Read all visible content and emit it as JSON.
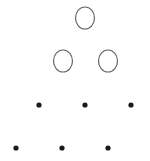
{
  "diagram": {
    "background": "#ffffff",
    "stroke_color": "#666666",
    "dot_color": "#1a1a1a",
    "circles": [
      {
        "cx": 85,
        "cy": 18,
        "rx": 9.5,
        "ry": 11
      },
      {
        "cx": 63,
        "cy": 61,
        "rx": 9.5,
        "ry": 11
      },
      {
        "cx": 108,
        "cy": 61,
        "rx": 9.5,
        "ry": 11
      }
    ],
    "dots": [
      {
        "cx": 39,
        "cy": 105,
        "r": 2.6
      },
      {
        "cx": 85,
        "cy": 105,
        "r": 2.6
      },
      {
        "cx": 131,
        "cy": 105,
        "r": 2.6
      },
      {
        "cx": 16,
        "cy": 148,
        "r": 2.6
      },
      {
        "cx": 62,
        "cy": 148,
        "r": 2.6
      },
      {
        "cx": 108,
        "cy": 148,
        "r": 2.6
      }
    ]
  }
}
